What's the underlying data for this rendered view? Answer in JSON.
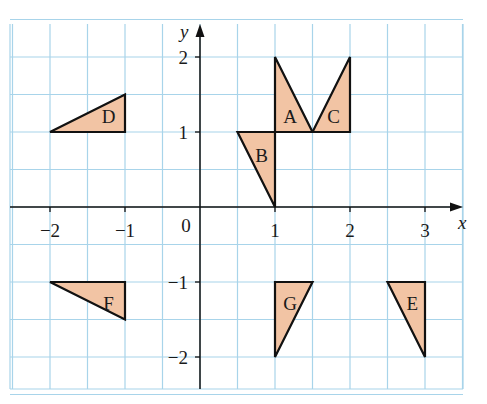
{
  "figure": {
    "axes": {
      "x_label": "x",
      "y_label": "y",
      "origin_label": "0",
      "x_ticks": [
        {
          "value": -2,
          "label": "−2"
        },
        {
          "value": -1,
          "label": "−1"
        },
        {
          "value": 1,
          "label": "1"
        },
        {
          "value": 2,
          "label": "2"
        },
        {
          "value": 3,
          "label": "3"
        }
      ],
      "y_ticks": [
        {
          "value": 2,
          "label": "2"
        },
        {
          "value": 1,
          "label": "1"
        },
        {
          "value": -1,
          "label": "−1"
        },
        {
          "value": -2,
          "label": "−2"
        }
      ],
      "x_range": [
        -2.5,
        3.5
      ],
      "y_range": [
        -2.5,
        2.5
      ],
      "grid_step": 0.5
    },
    "colors": {
      "grid": "#a8d4ea",
      "fill": "#f2c4a4",
      "outline": "#111111",
      "axis": "#111111"
    },
    "triangles": [
      {
        "label": "A",
        "vertices": [
          [
            1,
            1
          ],
          [
            1,
            2
          ],
          [
            1.5,
            1
          ]
        ],
        "label_pos": [
          1.2,
          1.22
        ]
      },
      {
        "label": "B",
        "vertices": [
          [
            0.5,
            1
          ],
          [
            1,
            1
          ],
          [
            1,
            0
          ]
        ],
        "label_pos": [
          0.82,
          0.7
        ]
      },
      {
        "label": "C",
        "vertices": [
          [
            1.5,
            1
          ],
          [
            2,
            2
          ],
          [
            2,
            1
          ]
        ],
        "label_pos": [
          1.78,
          1.22
        ]
      },
      {
        "label": "D",
        "vertices": [
          [
            -2,
            1
          ],
          [
            -1,
            1.5
          ],
          [
            -1,
            1
          ]
        ],
        "label_pos": [
          -1.22,
          1.22
        ]
      },
      {
        "label": "E",
        "vertices": [
          [
            2.5,
            -1
          ],
          [
            3,
            -1
          ],
          [
            3,
            -2
          ]
        ],
        "label_pos": [
          2.83,
          -1.28
        ]
      },
      {
        "label": "F",
        "vertices": [
          [
            -2,
            -1
          ],
          [
            -1,
            -1
          ],
          [
            -1,
            -1.5
          ]
        ],
        "label_pos": [
          -1.22,
          -1.28
        ]
      },
      {
        "label": "G",
        "vertices": [
          [
            1,
            -1
          ],
          [
            1.5,
            -1
          ],
          [
            1,
            -2
          ]
        ],
        "label_pos": [
          1.2,
          -1.28
        ]
      }
    ]
  }
}
